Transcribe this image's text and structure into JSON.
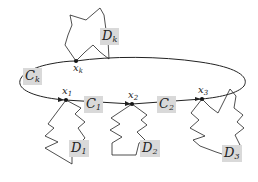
{
  "diagram": {
    "type": "curve-with-attached-regions",
    "curve": {
      "shape": "ellipse",
      "color": "#222222"
    },
    "shaded_label_color": "#d9d9d9",
    "labels": {
      "Dk": {
        "base": "D",
        "sub": "k"
      },
      "Ck": {
        "base": "C",
        "sub": "k"
      },
      "xk": {
        "base": "x",
        "sub": "k"
      },
      "x1": {
        "base": "x",
        "sub": "1"
      },
      "x2": {
        "base": "x",
        "sub": "2"
      },
      "x3": {
        "base": "x",
        "sub": "3"
      },
      "C1": {
        "base": "C",
        "sub": "1"
      },
      "C2": {
        "base": "C",
        "sub": "2"
      },
      "D1": {
        "base": "D",
        "sub": "1"
      },
      "D2": {
        "base": "D",
        "sub": "2"
      },
      "D3": {
        "base": "D",
        "sub": "3"
      }
    },
    "points": [
      "x_k",
      "x_1",
      "x_2",
      "x_3"
    ],
    "arcs": [
      "C_k",
      "C_1",
      "C_2"
    ],
    "regions": [
      "D_k",
      "D_1",
      "D_2",
      "D_3"
    ]
  }
}
